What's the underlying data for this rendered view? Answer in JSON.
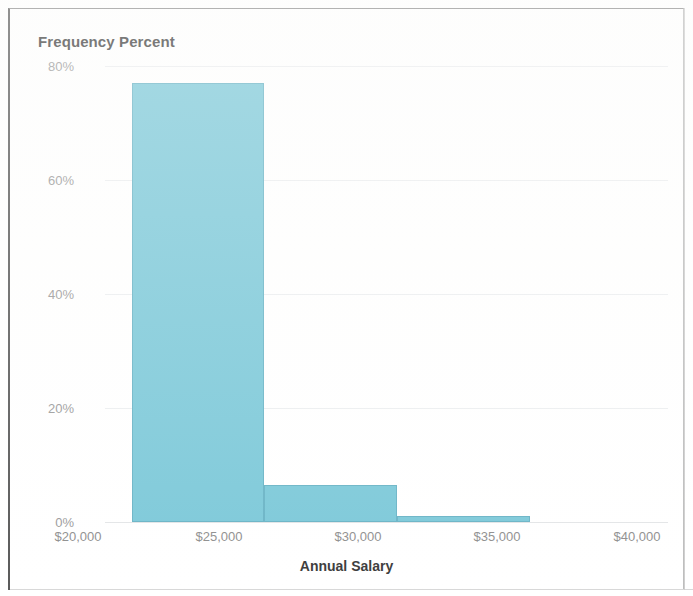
{
  "chart_data": {
    "type": "bar",
    "title": "Frequency Percent",
    "subtitle": "",
    "xlabel": "Annual Salary",
    "ylabel": "Frequency Percent",
    "grid": true,
    "legend": "none",
    "orientation": "vertical",
    "histogram": true,
    "bin_width": 5000,
    "xlim": [
      20000,
      41000
    ],
    "ylim": [
      0,
      80
    ],
    "ytick_labels": [
      "0%",
      "20%",
      "40%",
      "60%",
      "80%"
    ],
    "ytick_values": [
      0,
      20,
      40,
      60,
      80
    ],
    "xtick_labels": [
      "$20,000",
      "$25,000",
      "$30,000",
      "$35,000",
      "$40,000"
    ],
    "xtick_values": [
      20000,
      25000,
      30000,
      35000,
      40000
    ],
    "bin_edges": [
      21000,
      26000,
      31000,
      36000,
      41000
    ],
    "categories": [
      "$21,000-$26,000",
      "$26,000-$31,000",
      "$31,000-$36,000",
      "$36,000-$41,000"
    ],
    "values": [
      15,
      77,
      6.5,
      1
    ],
    "series": [
      {
        "name": "Frequency Percent",
        "values": [
          15,
          77,
          6.5,
          1
        ],
        "color": "#7dc9d9"
      }
    ],
    "bar_color": "#7dc9d9",
    "bar_border_color": "#6ab4c6",
    "gridline_color": "#eceef0",
    "tick_label_color": "#9b9b9b",
    "title_color": "#3c3c3c"
  },
  "ticks": {
    "y": [
      {
        "label": "80%",
        "value": 80
      },
      {
        "label": "60%",
        "value": 60
      },
      {
        "label": "40%",
        "value": 40
      },
      {
        "label": "20%",
        "value": 20
      },
      {
        "label": "0%",
        "value": 0
      }
    ],
    "x": [
      {
        "label": "$20,000",
        "value": 20000
      },
      {
        "label": "$25,000",
        "value": 25000
      },
      {
        "label": "$30,000",
        "value": 30000
      },
      {
        "label": "$35,000",
        "value": 35000
      },
      {
        "label": "$40,000",
        "value": 40000
      }
    ]
  },
  "axis": {
    "x_title": "Annual Salary",
    "y_title": "Frequency Percent"
  }
}
